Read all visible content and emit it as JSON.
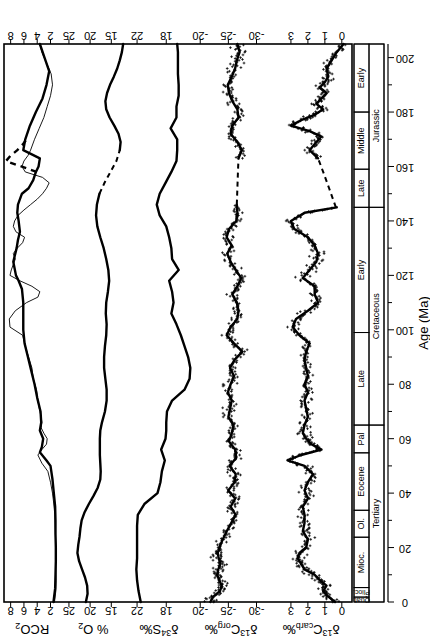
{
  "figure": {
    "orientation": "rotated-90-ccw",
    "xlabel": "Age (Ma)",
    "xlim": [
      0,
      205
    ],
    "xticks_major": [
      0,
      20,
      40,
      60,
      80,
      100,
      120,
      140,
      160,
      180,
      200
    ],
    "xticks_minor": [
      10,
      30,
      50,
      70,
      90,
      110,
      130,
      150,
      170,
      190
    ],
    "ink": "#000000",
    "paper": "#ffffff"
  },
  "timescale": {
    "label": "geologic-time-scale",
    "periods": [
      {
        "name": "Tertiary",
        "start": 0,
        "end": 65
      },
      {
        "name": "Cretaceous",
        "start": 65,
        "end": 145
      },
      {
        "name": "Jurassic",
        "start": 145,
        "end": 205
      }
    ],
    "epochs": [
      {
        "name": "Quat.",
        "start": 0,
        "end": 1.8,
        "abbr": true
      },
      {
        "name": "Plioc.",
        "start": 1.8,
        "end": 5.3,
        "abbr": true
      },
      {
        "name": "Mioc.",
        "start": 5.3,
        "end": 23.8
      },
      {
        "name": "Ol.",
        "start": 23.8,
        "end": 33.7
      },
      {
        "name": "Eocene",
        "start": 33.7,
        "end": 54.8
      },
      {
        "name": "Pal",
        "start": 54.8,
        "end": 65
      },
      {
        "name": "Late",
        "start": 65,
        "end": 99
      },
      {
        "name": "Early",
        "start": 99,
        "end": 145
      },
      {
        "name": "Late",
        "start": 145,
        "end": 159
      },
      {
        "name": "Middle",
        "start": 159,
        "end": 180
      },
      {
        "name": "Early",
        "start": 180,
        "end": 205
      }
    ]
  },
  "chart_data": [
    {
      "type": "line",
      "panel": "RCO2",
      "title": "RCO2",
      "ylabel": "RCO2",
      "xlabel": "Age (Ma)",
      "ylim": [
        0.5,
        9.0
      ],
      "yticks": [
        2,
        4,
        6,
        8
      ],
      "grid": false,
      "legend": "none",
      "series": [
        {
          "name": "GEOCARB smoothed",
          "style": "thick-solid",
          "x": [
            0,
            5,
            10,
            15,
            20,
            25,
            30,
            35,
            40,
            45,
            50,
            52,
            55,
            57,
            60,
            63,
            66,
            70,
            75,
            80,
            85,
            90,
            95,
            100,
            105,
            110,
            115,
            118,
            120,
            125,
            130,
            133,
            136,
            140,
            143,
            146,
            150,
            152,
            155,
            158,
            160,
            163,
            166,
            170,
            175,
            180,
            185,
            190,
            195,
            200,
            205
          ],
          "y": [
            1.55,
            1.3,
            1.25,
            1.2,
            1.2,
            1.25,
            1.25,
            1.3,
            1.5,
            1.7,
            2.0,
            2.6,
            3.6,
            3.3,
            3.1,
            3.6,
            3.4,
            3.5,
            4.0,
            4.4,
            4.9,
            5.4,
            5.9,
            6.1,
            6.1,
            6.1,
            6.3,
            6.8,
            7.2,
            7.6,
            7.1,
            6.9,
            6.6,
            6.8,
            7.0,
            6.9,
            6.3,
            5.3,
            4.6,
            4.2,
            3.8,
            3.6,
            6.1,
            5.8,
            5.1,
            4.2,
            3.2,
            2.6,
            2.2,
            2.9,
            3.6
          ]
        },
        {
          "name": "GEOCARB high-resolution",
          "style": "thin-solid",
          "x": [
            0,
            4,
            8,
            12,
            16,
            20,
            24,
            28,
            32,
            36,
            40,
            44,
            48,
            51,
            54,
            56,
            58,
            60,
            62,
            64,
            66,
            68,
            70,
            74,
            78,
            82,
            86,
            90,
            94,
            98,
            101,
            104,
            107,
            110,
            112,
            114,
            116,
            118,
            120,
            122,
            124,
            126,
            128,
            130,
            132,
            134,
            136,
            138,
            140,
            142,
            144,
            146,
            148,
            150,
            152,
            154,
            156,
            158,
            160,
            162,
            164,
            166,
            170,
            174,
            178,
            182,
            186,
            190,
            194,
            198,
            202,
            205
          ],
          "y": [
            1.4,
            1.2,
            1.15,
            1.2,
            1.25,
            1.2,
            1.25,
            1.3,
            1.35,
            1.5,
            1.7,
            2.0,
            2.4,
            3.3,
            3.9,
            3.3,
            2.6,
            2.5,
            3.0,
            3.4,
            3.3,
            3.4,
            3.6,
            3.9,
            4.1,
            4.6,
            4.8,
            5.3,
            5.8,
            6.2,
            8.1,
            8.2,
            7.3,
            5.6,
            3.9,
            3.6,
            4.8,
            6.6,
            8.1,
            7.9,
            7.6,
            7.3,
            7.6,
            7.0,
            6.2,
            5.9,
            7.2,
            7.6,
            7.4,
            6.9,
            6.0,
            5.0,
            4.0,
            3.2,
            2.6,
            2.2,
            3.2,
            5.8,
            6.3,
            6.0,
            5.4,
            5.0,
            4.4,
            3.7,
            3.0,
            2.5,
            2.0,
            1.7,
            1.9,
            2.6,
            3.3,
            3.6
          ]
        },
        {
          "name": "interpolated gap",
          "style": "dashed",
          "x": [
            158,
            160,
            162,
            164,
            166,
            168,
            170
          ],
          "y": [
            4.1,
            6.4,
            8.7,
            8.0,
            7.0,
            6.2,
            5.6
          ]
        }
      ]
    },
    {
      "type": "line",
      "panel": "O2",
      "title": "% O2",
      "ylabel": "% O2",
      "ylim": [
        11.5,
        27.0
      ],
      "yticks": [
        15,
        20,
        25
      ],
      "grid": false,
      "legend": "none",
      "series": [
        {
          "name": "atmospheric oxygen",
          "style": "thick-solid",
          "x": [
            0,
            3,
            6,
            9,
            12,
            15,
            18,
            21,
            24,
            27,
            30,
            33,
            36,
            39,
            42,
            45,
            48,
            51,
            54,
            57,
            60,
            63,
            66,
            70,
            74,
            78,
            82,
            86,
            90,
            94,
            98,
            102,
            106,
            110,
            114,
            118,
            122,
            126,
            130,
            134,
            138,
            142,
            146,
            150
          ],
          "y": [
            21.0,
            20.6,
            20.7,
            21.2,
            21.9,
            22.6,
            23.0,
            22.8,
            22.5,
            22.3,
            22.0,
            21.3,
            20.3,
            19.2,
            18.2,
            17.6,
            17.5,
            17.6,
            17.7,
            17.7,
            17.7,
            17.6,
            17.2,
            16.5,
            16.1,
            16.1,
            16.4,
            16.7,
            16.7,
            16.5,
            16.2,
            16.1,
            16.3,
            16.2,
            15.8,
            15.5,
            15.7,
            16.2,
            16.8,
            17.6,
            18.3,
            18.6,
            18.4,
            17.8
          ]
        },
        {
          "name": "interpolated gap",
          "style": "dashed",
          "x": [
            150,
            154,
            158,
            162,
            166
          ],
          "y": [
            17.8,
            16.6,
            15.2,
            13.8,
            13.0
          ]
        },
        {
          "name": "atmospheric oxygen (Jurassic)",
          "style": "thick-solid",
          "x": [
            166,
            169,
            172,
            175,
            178,
            181,
            184,
            187,
            190,
            193,
            196,
            199,
            202,
            205
          ],
          "y": [
            13.0,
            12.8,
            13.3,
            14.3,
            15.4,
            16.2,
            16.4,
            16.0,
            15.3,
            14.4,
            13.6,
            13.0,
            12.5,
            12.2
          ]
        }
      ]
    },
    {
      "type": "line",
      "panel": "d34S",
      "title": "δ34S‰",
      "ylabel": "δ34S‰",
      "ylim": [
        14.5,
        23.5
      ],
      "yticks": [
        18,
        22
      ],
      "grid": false,
      "legend": "none",
      "series": [
        {
          "name": "sulfate sulfur isotopes",
          "style": "thick-solid",
          "x": [
            0,
            4,
            8,
            12,
            16,
            20,
            24,
            28,
            32,
            36,
            40,
            44,
            48,
            52,
            56,
            60,
            63,
            66,
            70,
            74,
            78,
            82,
            86,
            90,
            94,
            98,
            102,
            106,
            110,
            114,
            118,
            122,
            126,
            130,
            134,
            138,
            142,
            146,
            150,
            154,
            158,
            162,
            166,
            170,
            174,
            178,
            182,
            186,
            190,
            194,
            198,
            202,
            205
          ],
          "y": [
            21.5,
            21.8,
            22.0,
            22.1,
            22.0,
            22.0,
            22.0,
            22.0,
            21.9,
            21.0,
            19.2,
            18.8,
            18.6,
            18.2,
            18.7,
            18.1,
            18.0,
            18.0,
            17.9,
            17.2,
            15.5,
            14.8,
            14.7,
            15.0,
            15.5,
            16.0,
            16.6,
            17.3,
            17.0,
            17.2,
            17.6,
            16.3,
            17.2,
            17.3,
            17.6,
            18.0,
            18.9,
            19.3,
            18.9,
            18.1,
            17.3,
            16.6,
            16.5,
            16.5,
            17.4,
            16.6,
            16.6,
            16.3,
            16.3,
            16.4,
            16.4,
            16.4,
            16.5
          ]
        }
      ]
    },
    {
      "type": "scatter+line",
      "panel": "d13Corg",
      "title": "δ13Corg‰",
      "ylabel": "δ13Corg‰",
      "ylim": [
        -32.5,
        -18.5
      ],
      "yticks": [
        -30,
        -25,
        -20
      ],
      "grid": false,
      "legend": "none",
      "scatter_marker": "plus",
      "scatter_note": "dense cloud of individual organic carbon isotope measurements",
      "series": [
        {
          "name": "running mean",
          "style": "thick-solid",
          "x": [
            0,
            2,
            4,
            6,
            8,
            10,
            12,
            14,
            16,
            18,
            20,
            23,
            26,
            29,
            32,
            35,
            38,
            41,
            44,
            47,
            50,
            53,
            56,
            59,
            62,
            65,
            68,
            71,
            74,
            77,
            80,
            83,
            86,
            89,
            92,
            95,
            98,
            101,
            104,
            107,
            110,
            113,
            116,
            119,
            122,
            125,
            128,
            131,
            134,
            137,
            140,
            143,
            146
          ],
          "y": [
            -21.8,
            -22.3,
            -23.5,
            -23.8,
            -23.4,
            -23.0,
            -23.2,
            -23.6,
            -23.3,
            -23.1,
            -23.4,
            -24.0,
            -24.7,
            -25.5,
            -26.3,
            -25.4,
            -26.2,
            -25.0,
            -26.1,
            -26.3,
            -25.2,
            -26.4,
            -26.2,
            -25.1,
            -25.6,
            -25.9,
            -25.0,
            -25.3,
            -25.6,
            -24.9,
            -25.4,
            -26.0,
            -25.3,
            -26.1,
            -27.5,
            -26.0,
            -24.7,
            -25.4,
            -26.6,
            -26.8,
            -26.5,
            -25.7,
            -26.6,
            -27.3,
            -26.3,
            -25.4,
            -24.8,
            -25.6,
            -24.7,
            -25.1,
            -26.4,
            -26.6,
            -26.5
          ]
        },
        {
          "name": "interpolated gap",
          "style": "dashed",
          "x": [
            146,
            152,
            158,
            163
          ],
          "y": [
            -26.5,
            -26.6,
            -26.7,
            -26.8
          ]
        },
        {
          "name": "running mean (Jurassic)",
          "style": "thick-solid",
          "x": [
            163,
            166,
            169,
            172,
            175,
            178,
            181,
            184,
            187,
            190,
            193,
            196,
            199,
            202,
            205
          ],
          "y": [
            -26.8,
            -27.4,
            -26.6,
            -25.4,
            -25.7,
            -26.8,
            -26.6,
            -25.7,
            -25.1,
            -24.9,
            -25.6,
            -26.2,
            -26.5,
            -27.0,
            -26.6
          ]
        }
      ]
    },
    {
      "type": "scatter+line",
      "panel": "d13Ccarb",
      "title": "δ13Ccarb‰",
      "ylabel": "δ13Ccarb‰",
      "ylim": [
        -0.6,
        4.2
      ],
      "yticks": [
        0,
        1,
        2,
        3
      ],
      "grid": false,
      "legend": "none",
      "scatter_marker": "plus",
      "scatter_note": "dense cloud of individual carbonate carbon isotope measurements",
      "series": [
        {
          "name": "running mean",
          "style": "thick-solid",
          "x": [
            0,
            2,
            4,
            6,
            8,
            10,
            12,
            14,
            16,
            18,
            20,
            23,
            26,
            29,
            32,
            35,
            38,
            41,
            44,
            47,
            50,
            52,
            54,
            56,
            58,
            60,
            62,
            65,
            68,
            71,
            74,
            77,
            80,
            83,
            86,
            89,
            92,
            95,
            98,
            101,
            104,
            107,
            110,
            113,
            116,
            119,
            122,
            125,
            128,
            131,
            134,
            137,
            140,
            143,
            145
          ],
          "y": [
            0.4,
            0.8,
            1.1,
            0.9,
            1.3,
            1.6,
            2.2,
            2.4,
            2.6,
            2.5,
            2.1,
            2.0,
            2.3,
            2.2,
            2.2,
            2.3,
            2.0,
            2.2,
            2.0,
            1.7,
            2.2,
            3.2,
            2.4,
            1.2,
            1.8,
            2.1,
            2.3,
            2.2,
            2.0,
            2.1,
            2.2,
            2.0,
            2.2,
            2.0,
            2.1,
            2.2,
            2.1,
            1.9,
            2.5,
            2.9,
            2.7,
            2.0,
            1.4,
            1.6,
            1.6,
            2.3,
            1.9,
            1.5,
            1.4,
            1.6,
            2.0,
            2.8,
            3.0,
            2.2,
            0.3
          ]
        },
        {
          "name": "interpolated gap",
          "style": "dashed",
          "x": [
            145,
            152,
            158,
            163
          ],
          "y": [
            0.35,
            0.75,
            1.1,
            1.4
          ]
        },
        {
          "name": "running mean (Jurassic)",
          "style": "thick-solid",
          "x": [
            163,
            166,
            169,
            171,
            173,
            175,
            177,
            179,
            181,
            183,
            185,
            187,
            189,
            191,
            193,
            196,
            199,
            202,
            205
          ],
          "y": [
            1.4,
            1.9,
            1.5,
            1.2,
            1.9,
            3.0,
            2.4,
            1.6,
            1.1,
            1.5,
            1.2,
            0.9,
            1.3,
            1.0,
            0.8,
            0.9,
            0.6,
            0.3,
            -0.1
          ]
        }
      ]
    }
  ]
}
